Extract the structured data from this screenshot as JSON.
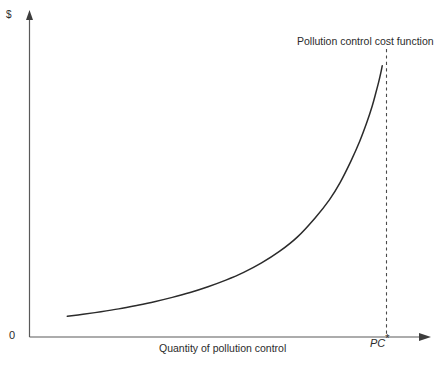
{
  "chart_data": {
    "type": "line",
    "title": "",
    "subtitle": "",
    "xlabel": "Quantity of pollution control",
    "ylabel": "$",
    "origin_label": "0",
    "grid": false,
    "legend_position": "inline-annotation-top-right",
    "annotations": [
      {
        "name": "curve-annotation",
        "text": "Pollution control cost function",
        "x_px": 297,
        "y_px": 36
      },
      {
        "name": "threshold-label",
        "text": "PC",
        "superscript": "*",
        "x_px": 370,
        "y_px": 338
      }
    ],
    "axes": {
      "x_axis_arrow": true,
      "y_axis_arrow": true,
      "x_ticks": [],
      "y_ticks": [],
      "xlim": [
        0,
        1
      ],
      "ylim": [
        0,
        1
      ]
    },
    "series": [
      {
        "name": "Pollution control cost function",
        "color": "#2b2b2b",
        "style": "solid",
        "asymptote_x": 1.0,
        "x": [
          0.106,
          0.15,
          0.2,
          0.25,
          0.3,
          0.35,
          0.4,
          0.45,
          0.5,
          0.55,
          0.6,
          0.65,
          0.7,
          0.75,
          0.8,
          0.84,
          0.87,
          0.9,
          0.925,
          0.945,
          0.96,
          0.97,
          0.978,
          0.984,
          0.988
        ],
        "y": [
          0.072,
          0.079,
          0.088,
          0.098,
          0.11,
          0.123,
          0.138,
          0.155,
          0.175,
          0.198,
          0.225,
          0.258,
          0.298,
          0.348,
          0.415,
          0.478,
          0.538,
          0.612,
          0.682,
          0.748,
          0.805,
          0.85,
          0.888,
          0.92,
          0.945
        ]
      }
    ],
    "reference_lines": [
      {
        "name": "threshold-dashed-line",
        "orientation": "vertical",
        "x": 1.0,
        "style": "dashed",
        "color": "#4a4a4a",
        "label": "PC*"
      }
    ],
    "colors": {
      "background": "#ffffff",
      "axis": "#5a5a5a",
      "curve": "#2b2b2b",
      "dashed": "#4a4a4a",
      "text": "#2b2b2b"
    }
  }
}
